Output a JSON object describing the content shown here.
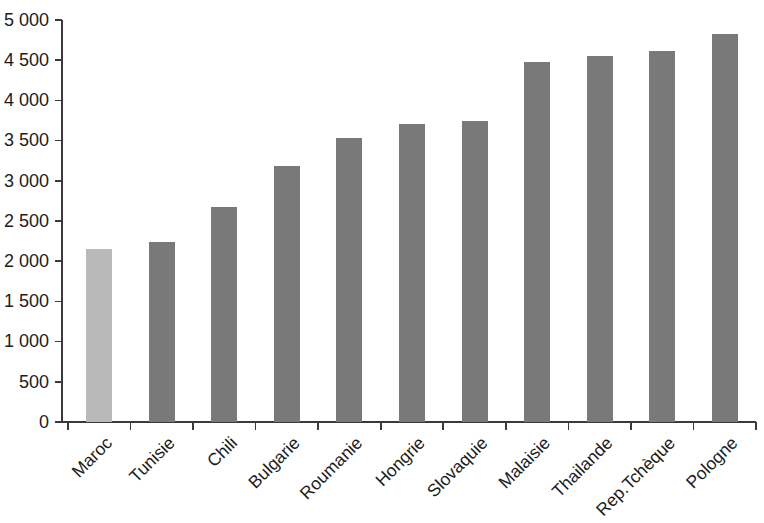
{
  "chart_data": {
    "type": "bar",
    "title": "",
    "subtitle": "",
    "xlabel": "",
    "ylabel": "",
    "categories": [
      "Maroc",
      "Tunisie",
      "Chili",
      "Bulgarie",
      "Roumanie",
      "Hongrie",
      "Slovaquie",
      "Malaisie",
      "Thailande",
      "Rep.Tchèque",
      "Pologne"
    ],
    "values": [
      2150,
      2240,
      2670,
      3185,
      3530,
      3710,
      3745,
      4480,
      4550,
      4610,
      4820
    ],
    "ylim": [
      0,
      5000
    ],
    "ytick_values": [
      0,
      500,
      1000,
      1500,
      2000,
      2500,
      3000,
      3500,
      4000,
      4500,
      5000
    ],
    "ytick_labels": [
      "0",
      "500",
      "1 000",
      "1 500",
      "2 000",
      "2 500",
      "3 000",
      "3 500",
      "4 000",
      "4 500",
      "5 000"
    ],
    "grid": false,
    "legend": null,
    "legend_position": "none",
    "bar_colors": [
      "#b9b9b9",
      "#797979",
      "#797979",
      "#797979",
      "#797979",
      "#797979",
      "#797979",
      "#797979",
      "#797979",
      "#797979",
      "#797979"
    ],
    "highlight_category": "Maroc",
    "xtick_label_rotation": 45,
    "axis_color": "#3a3a3a",
    "background_color": "#ffffff",
    "text_color": "#1c1c1c"
  }
}
